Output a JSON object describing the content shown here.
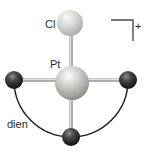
{
  "figure": {
    "kind": "molecular-structure-diagram",
    "species": "[Pt(dien)Cl]+ cation, ball-and-stick with chelate arc"
  },
  "labels": {
    "cl": "Cl",
    "pt": "Pt",
    "dien": "dien",
    "charge": "+"
  },
  "atoms": [
    {
      "element": "Cl",
      "label": "Cl",
      "x": 70,
      "y": 23,
      "radius": 13,
      "style": "light-gray"
    },
    {
      "element": "Pt",
      "label": "Pt",
      "x": 72,
      "y": 83,
      "radius": 17,
      "style": "silver"
    },
    {
      "element": "N",
      "label": "",
      "x": 14,
      "y": 80,
      "radius": 9,
      "style": "dark"
    },
    {
      "element": "N",
      "label": "",
      "x": 128,
      "y": 80,
      "radius": 9,
      "style": "dark"
    },
    {
      "element": "N",
      "label": "",
      "x": 71,
      "y": 137,
      "radius": 9,
      "style": "dark"
    }
  ],
  "bonds": [
    {
      "from": "Cl",
      "to": "Pt"
    },
    {
      "from": "N-left",
      "to": "Pt"
    },
    {
      "from": "N-right",
      "to": "Pt"
    },
    {
      "from": "N-bottom",
      "to": "Pt"
    }
  ],
  "chelate": {
    "label": "dien",
    "connects": [
      "N-left",
      "N-bottom",
      "N-right"
    ],
    "shape": "semicircular-arc"
  },
  "colors": {
    "background": "#ffffff",
    "bond": "#b3b3af",
    "bond_highlight": "#e2e2df",
    "arc": "#1a1a1a",
    "bracket": "#4a4a4a",
    "text": "#2a2a2a",
    "sphere_cl_mid": "#d6d6d2",
    "sphere_pt_mid": "#bcbcb8",
    "sphere_n_dark": "#1c1c1c"
  }
}
